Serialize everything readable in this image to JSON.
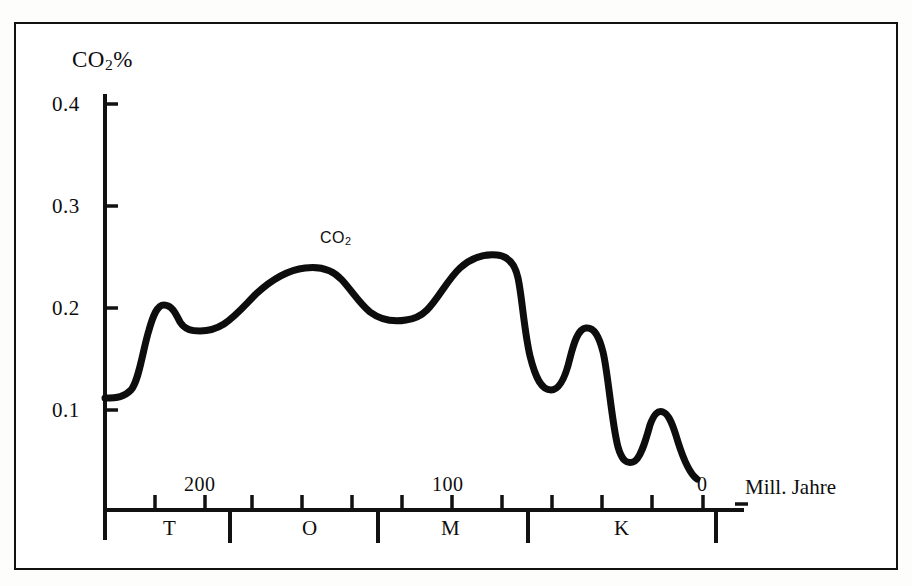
{
  "chart_data": {
    "type": "line",
    "title": "CO2%",
    "title_html": "CO<sub>2</sub>%",
    "xlabel": "Mill. Jahre",
    "ylabel": "CO2 %",
    "series_label": "CO2",
    "series_label_html": "CO<sub>2</sub>",
    "grid": false,
    "legend_position": "inline-annotation",
    "xlim": [
      250,
      -12
    ],
    "ylim": [
      0,
      0.43
    ],
    "x_axis_direction": "reversed",
    "y_ticks": [
      0.4,
      0.3,
      0.2,
      0.1
    ],
    "y_tick_labels": [
      "0.4",
      "0.3",
      "0.2",
      "0.1"
    ],
    "x_ticks": [
      250,
      225,
      200,
      175,
      150,
      125,
      100,
      75,
      50,
      25,
      0
    ],
    "x_tick_labels": [
      "",
      "",
      "200",
      "",
      "",
      "",
      "100",
      "",
      "",
      "",
      "0"
    ],
    "x_labeled_ticks": [
      {
        "value": 200,
        "label": "200"
      },
      {
        "value": 100,
        "label": "100"
      },
      {
        "value": 0,
        "label": "0"
      }
    ],
    "era_bands": [
      {
        "code": "T",
        "name": "Tertiaer",
        "start": 250,
        "end": 187
      },
      {
        "code": "O",
        "name": "Obere Kreide",
        "start": 187,
        "end": 113
      },
      {
        "code": "M",
        "name": "Mittlere",
        "start": 113,
        "end": 38
      },
      {
        "code": "K",
        "name": "Kreide",
        "start": 38,
        "end": -6
      }
    ],
    "era_boundaries": [
      187,
      113,
      38,
      -6
    ],
    "x": [
      250,
      244,
      238,
      232,
      226,
      220,
      213,
      206,
      199,
      192,
      185,
      178,
      170,
      162,
      154,
      146,
      138,
      130,
      122,
      114,
      106,
      98,
      90,
      82,
      74,
      66,
      58,
      52,
      46,
      40,
      34,
      28,
      22,
      16,
      10,
      4,
      0
    ],
    "values": [
      0.11,
      0.11,
      0.112,
      0.124,
      0.156,
      0.188,
      0.202,
      0.199,
      0.188,
      0.179,
      0.177,
      0.181,
      0.193,
      0.21,
      0.225,
      0.235,
      0.236,
      0.228,
      0.213,
      0.196,
      0.189,
      0.188,
      0.197,
      0.219,
      0.24,
      0.251,
      0.25,
      0.231,
      0.18,
      0.134,
      0.122,
      0.146,
      0.181,
      0.16,
      0.065,
      0.053,
      0.072
    ],
    "annotations": [
      {
        "text": "CO2",
        "x": 148,
        "y": 0.263
      }
    ]
  },
  "axis": {
    "y_title_html": "CO<sub>2</sub>%",
    "y_labels": [
      "0.4",
      "0.3",
      "0.2",
      "0.1"
    ],
    "x_labels": [
      "200",
      "100",
      "0"
    ],
    "x_unit": "Mill. Jahre",
    "era_labels": [
      "T",
      "O",
      "M",
      "K"
    ]
  },
  "series": {
    "label_html": "CO<sub>2</sub>"
  },
  "colors": {
    "line": "#0d0d0d",
    "axis": "#111111",
    "frame": "#111111",
    "background": "#ffffff",
    "page": "#fdfdfc"
  }
}
